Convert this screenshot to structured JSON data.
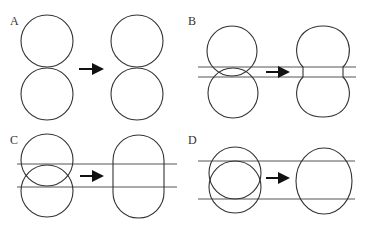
{
  "figure": {
    "cropped_caption": "",
    "panels": [
      {
        "label": "A",
        "label_pos": [
          10,
          26
        ],
        "before": {
          "circles": [
            {
              "cx": 47,
              "cy": 41,
              "r": 26
            },
            {
              "cx": 47,
              "cy": 94,
              "r": 26
            }
          ]
        },
        "arrow": {
          "x1": 79,
          "x2": 104,
          "y": 69
        },
        "after": {
          "shape": "two-tangent-circles",
          "circles": [
            {
              "cx": 137,
              "cy": 41,
              "r": 26
            },
            {
              "cx": 137,
              "cy": 94,
              "r": 26
            }
          ]
        },
        "guide_lines": []
      },
      {
        "label": "B",
        "label_pos": [
          188,
          26
        ],
        "before": {
          "circles": [
            {
              "cx": 232,
              "cy": 51,
              "r": 25
            },
            {
              "cx": 233,
              "cy": 93,
              "r": 25
            }
          ]
        },
        "arrow": {
          "x1": 266,
          "x2": 290,
          "y": 72
        },
        "after": {
          "shape": "peanut",
          "cx": 323,
          "top": 26,
          "bottom": 117,
          "half_width": 26,
          "neck_half_width": 20,
          "neck_y1": 67,
          "neck_y2": 77
        },
        "guide_lines": [
          {
            "y": 67,
            "x1": 198,
            "x2": 356
          },
          {
            "y": 77,
            "x1": 198,
            "x2": 356
          }
        ]
      },
      {
        "label": "C",
        "label_pos": [
          10,
          145
        ],
        "before": {
          "circles": [
            {
              "cx": 47,
              "cy": 160,
              "r": 26
            },
            {
              "cx": 47,
              "cy": 191,
              "r": 26
            }
          ]
        },
        "arrow": {
          "x1": 80,
          "x2": 104,
          "y": 176
        },
        "after": {
          "shape": "capsule",
          "x": 113,
          "y": 135,
          "width": 51,
          "height": 83
        },
        "guide_lines": [
          {
            "y": 164,
            "x1": 17,
            "x2": 177
          },
          {
            "y": 187,
            "x1": 17,
            "x2": 177
          }
        ]
      },
      {
        "label": "D",
        "label_pos": [
          188,
          145
        ],
        "before": {
          "circles": [
            {
              "cx": 235,
              "cy": 173,
              "r": 26
            },
            {
              "cx": 235,
              "cy": 187,
              "r": 26
            }
          ]
        },
        "arrow": {
          "x1": 266,
          "x2": 290,
          "y": 178
        },
        "after": {
          "shape": "ellipse",
          "cx": 324,
          "cy": 181,
          "rx": 28,
          "ry": 33
        },
        "guide_lines": [
          {
            "y": 161,
            "x1": 198,
            "x2": 355
          },
          {
            "y": 199,
            "x1": 198,
            "x2": 355
          }
        ]
      }
    ],
    "colors": {
      "stroke": "#333333",
      "guide_line": "#555555",
      "arrow": "#111111",
      "background": "#ffffff"
    }
  }
}
